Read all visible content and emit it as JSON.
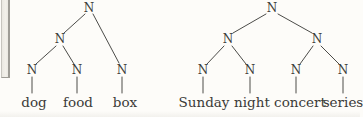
{
  "figure": {
    "type": "syntax-trees",
    "node_symbol": "N"
  },
  "colors": {
    "ink": "#3b3b38",
    "line": "#4c4c49",
    "page-bg": "#fdfcf9",
    "strip-fill": "#eae8e2",
    "strip-border": "#c7c5bf",
    "strip-edge": "#9e9c96"
  },
  "left_tree": {
    "bracketing_drawn": "[[dog food] box]",
    "nodes": [
      {
        "id": "root",
        "label": "N"
      },
      {
        "id": "inner",
        "label": "N"
      },
      {
        "id": "leaf-dog",
        "label": "N"
      },
      {
        "id": "leaf-food",
        "label": "N"
      },
      {
        "id": "leaf-box",
        "label": "N"
      }
    ],
    "edges": [
      [
        "root",
        "inner"
      ],
      [
        "root",
        "leaf-box"
      ],
      [
        "inner",
        "leaf-dog"
      ],
      [
        "inner",
        "leaf-food"
      ],
      [
        "leaf-dog",
        "dog"
      ],
      [
        "leaf-food",
        "food"
      ],
      [
        "leaf-box",
        "box"
      ]
    ],
    "words": [
      {
        "text": "dog"
      },
      {
        "text": "food"
      },
      {
        "text": "box"
      }
    ]
  },
  "right_tree": {
    "bracketing_drawn": "[[Sunday night] [concert series]]",
    "nodes": [
      {
        "id": "root",
        "label": "N"
      },
      {
        "id": "inner-left",
        "label": "N"
      },
      {
        "id": "inner-right",
        "label": "N"
      },
      {
        "id": "leaf-sunday",
        "label": "N"
      },
      {
        "id": "leaf-night",
        "label": "N"
      },
      {
        "id": "leaf-concert",
        "label": "N"
      },
      {
        "id": "leaf-series",
        "label": "N"
      }
    ],
    "edges": [
      [
        "root",
        "inner-left"
      ],
      [
        "root",
        "inner-right"
      ],
      [
        "inner-left",
        "leaf-sunday"
      ],
      [
        "inner-left",
        "leaf-night"
      ],
      [
        "inner-right",
        "leaf-concert"
      ],
      [
        "inner-right",
        "leaf-series"
      ],
      [
        "leaf-sunday",
        "Sunday"
      ],
      [
        "leaf-night",
        "night"
      ],
      [
        "leaf-concert",
        "concert"
      ],
      [
        "leaf-series",
        "series"
      ]
    ],
    "words": [
      {
        "text": "Sunday"
      },
      {
        "text": "night"
      },
      {
        "text": "concert"
      },
      {
        "text": "series"
      }
    ]
  }
}
